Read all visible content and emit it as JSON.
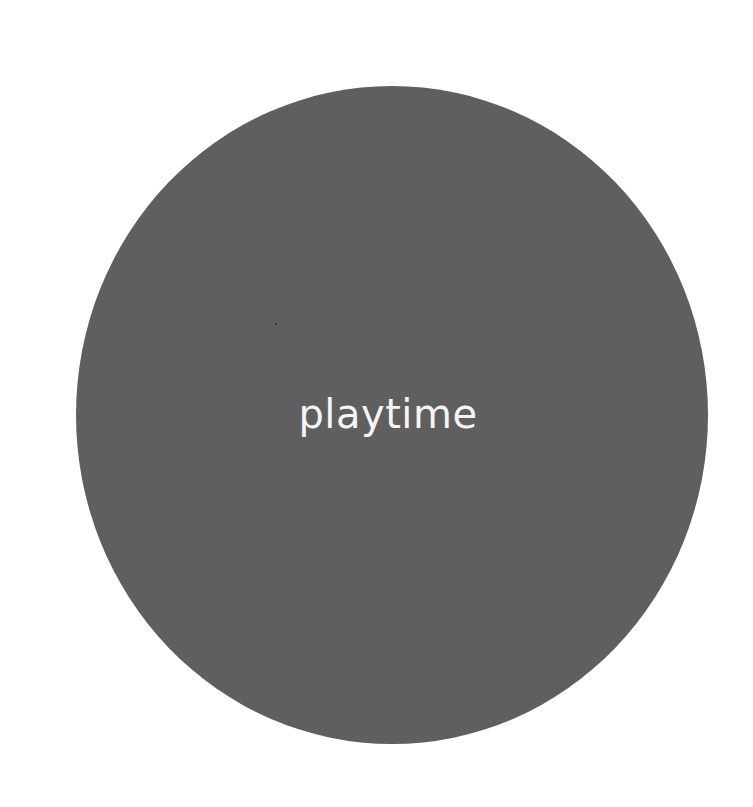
{
  "logo": {
    "text": "playtime",
    "background_color": "#ffffff",
    "circle_color": "#5f5f5f",
    "text_color": "#f4f4f4"
  }
}
